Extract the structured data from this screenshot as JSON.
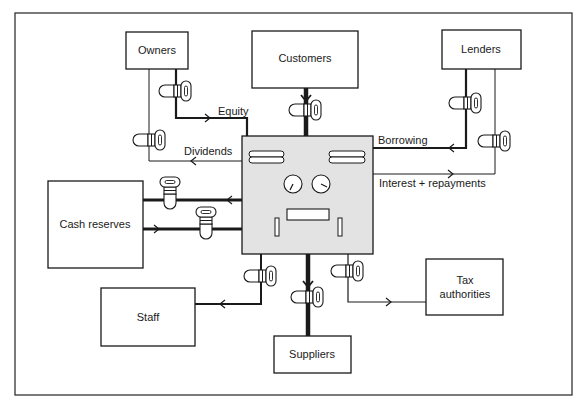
{
  "diagram": {
    "title": "",
    "colors": {
      "background": "#ffffff",
      "ink": "#1a1a1a",
      "machine_fill": "#e3e3e3"
    },
    "nodes": {
      "owners": {
        "label": "Owners"
      },
      "customers": {
        "label": "Customers"
      },
      "lenders": {
        "label": "Lenders"
      },
      "cash_reserves": {
        "label": "Cash reserves"
      },
      "staff": {
        "label": "Staff"
      },
      "tax_authorities": {
        "label_line1": "Tax",
        "label_line2": "authorities"
      },
      "suppliers": {
        "label": "Suppliers"
      },
      "business": {
        "label": "",
        "icon": "machine-icon"
      }
    },
    "flows": {
      "equity": {
        "label": "Equity",
        "from": "Owners",
        "to": "Business",
        "weight": "thick"
      },
      "dividends": {
        "label": "Dividends",
        "from": "Business",
        "to": "Owners",
        "weight": "thin"
      },
      "borrowing": {
        "label": "Borrowing",
        "from": "Lenders",
        "to": "Business",
        "weight": "thick"
      },
      "interest": {
        "label": "Interest + repayments",
        "from": "Business",
        "to": "Lenders",
        "weight": "thin"
      },
      "customers_in": {
        "label": "",
        "from": "Customers",
        "to": "Business",
        "weight": "very thick"
      },
      "to_cash": {
        "label": "",
        "from": "Business",
        "to": "Cash reserves",
        "weight": "very thick"
      },
      "from_cash": {
        "label": "",
        "from": "Cash reserves",
        "to": "Business",
        "weight": "very thick"
      },
      "to_staff": {
        "label": "",
        "from": "Business",
        "to": "Staff",
        "weight": "thick"
      },
      "to_tax": {
        "label": "",
        "from": "Business",
        "to": "Tax authorities",
        "weight": "thin"
      },
      "to_suppliers": {
        "label": "",
        "from": "Business",
        "to": "Suppliers",
        "weight": "very thick"
      }
    },
    "valve_icon": "tap-valve-icon"
  }
}
